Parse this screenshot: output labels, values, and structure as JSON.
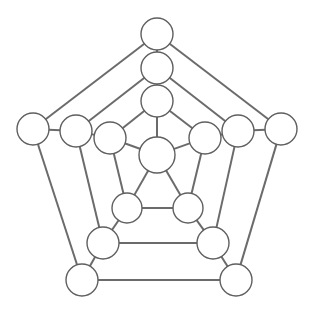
{
  "diagram": {
    "type": "node-link-graph",
    "background_color": "#ffffff",
    "edge_color": "#6b6b6b",
    "edge_width": 2,
    "node_fill": "#ffffff",
    "node_stroke": "#5f5f5f",
    "node_stroke_width": 1.4,
    "node_count": 16,
    "edge_count": 30,
    "canvas": {
      "width": 314,
      "height": 310
    }
  },
  "nodes": [
    {
      "id": "outer-top",
      "ring": "outer",
      "label": "",
      "cx": 157,
      "cy": 34,
      "r": 16
    },
    {
      "id": "outer-left",
      "ring": "outer",
      "label": "",
      "cx": 33,
      "cy": 129,
      "r": 16
    },
    {
      "id": "outer-right",
      "ring": "outer",
      "label": "",
      "cx": 281,
      "cy": 129,
      "r": 16
    },
    {
      "id": "outer-bottom-left",
      "ring": "outer",
      "label": "",
      "cx": 82,
      "cy": 280,
      "r": 16
    },
    {
      "id": "outer-bottom-right",
      "ring": "outer",
      "label": "",
      "cx": 236,
      "cy": 280,
      "r": 16
    },
    {
      "id": "mid-top",
      "ring": "middle",
      "label": "",
      "cx": 157,
      "cy": 68,
      "r": 16
    },
    {
      "id": "mid-left",
      "ring": "middle",
      "label": "",
      "cx": 76,
      "cy": 131,
      "r": 16
    },
    {
      "id": "mid-right",
      "ring": "middle",
      "label": "",
      "cx": 238,
      "cy": 131,
      "r": 16
    },
    {
      "id": "mid-bottom-left",
      "ring": "middle",
      "label": "",
      "cx": 103,
      "cy": 243,
      "r": 16
    },
    {
      "id": "mid-bottom-right",
      "ring": "middle",
      "label": "",
      "cx": 213,
      "cy": 243,
      "r": 16
    },
    {
      "id": "inner-top",
      "ring": "inner",
      "label": "",
      "cx": 157,
      "cy": 101,
      "r": 16
    },
    {
      "id": "inner-left",
      "ring": "inner",
      "label": "",
      "cx": 110,
      "cy": 138,
      "r": 16
    },
    {
      "id": "inner-right",
      "ring": "inner",
      "label": "",
      "cx": 205,
      "cy": 138,
      "r": 16
    },
    {
      "id": "inner-bottom-left",
      "ring": "inner",
      "label": "",
      "cx": 127,
      "cy": 208,
      "r": 15
    },
    {
      "id": "inner-bottom-right",
      "ring": "inner",
      "label": "",
      "cx": 188,
      "cy": 208,
      "r": 15
    },
    {
      "id": "hub-center",
      "ring": "center",
      "label": "",
      "cx": 157,
      "cy": 155,
      "r": 18
    }
  ],
  "edges": [
    {
      "from": "outer-top",
      "to": "outer-left"
    },
    {
      "from": "outer-top",
      "to": "outer-right"
    },
    {
      "from": "outer-left",
      "to": "outer-bottom-left"
    },
    {
      "from": "outer-right",
      "to": "outer-bottom-right"
    },
    {
      "from": "outer-bottom-left",
      "to": "outer-bottom-right"
    },
    {
      "from": "mid-top",
      "to": "mid-left"
    },
    {
      "from": "mid-top",
      "to": "mid-right"
    },
    {
      "from": "mid-left",
      "to": "mid-bottom-left"
    },
    {
      "from": "mid-right",
      "to": "mid-bottom-right"
    },
    {
      "from": "mid-bottom-left",
      "to": "mid-bottom-right"
    },
    {
      "from": "inner-top",
      "to": "inner-left"
    },
    {
      "from": "inner-top",
      "to": "inner-right"
    },
    {
      "from": "inner-left",
      "to": "inner-bottom-left"
    },
    {
      "from": "inner-right",
      "to": "inner-bottom-right"
    },
    {
      "from": "inner-bottom-left",
      "to": "inner-bottom-right"
    },
    {
      "from": "hub-center",
      "to": "inner-top"
    },
    {
      "from": "hub-center",
      "to": "inner-left"
    },
    {
      "from": "hub-center",
      "to": "inner-right"
    },
    {
      "from": "hub-center",
      "to": "inner-bottom-left"
    },
    {
      "from": "hub-center",
      "to": "inner-bottom-right"
    },
    {
      "from": "outer-top",
      "to": "mid-top"
    },
    {
      "from": "outer-left",
      "to": "mid-left"
    },
    {
      "from": "outer-right",
      "to": "mid-right"
    },
    {
      "from": "outer-bottom-left",
      "to": "mid-bottom-left"
    },
    {
      "from": "outer-bottom-right",
      "to": "mid-bottom-right"
    },
    {
      "from": "mid-top",
      "to": "inner-top"
    },
    {
      "from": "mid-left",
      "to": "inner-left"
    },
    {
      "from": "mid-right",
      "to": "inner-right"
    },
    {
      "from": "mid-bottom-left",
      "to": "inner-bottom-left"
    },
    {
      "from": "mid-bottom-right",
      "to": "inner-bottom-right"
    }
  ]
}
